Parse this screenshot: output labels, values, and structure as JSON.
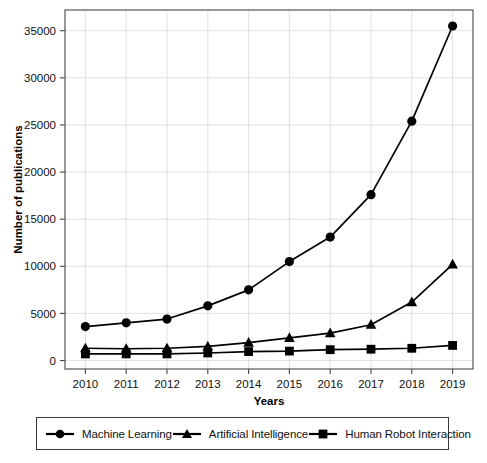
{
  "chart_data": {
    "type": "line",
    "title": "",
    "xlabel": "Years",
    "ylabel": "Number of publications",
    "categories": [
      2010,
      2011,
      2012,
      2013,
      2014,
      2015,
      2016,
      2017,
      2018,
      2019
    ],
    "x": [
      2010,
      2011,
      2012,
      2013,
      2014,
      2015,
      2016,
      2017,
      2018,
      2019
    ],
    "xtick_labels": [
      "2010",
      "2011",
      "2012",
      "2013",
      "2014",
      "2015",
      "2016",
      "2017",
      "2018",
      "2019"
    ],
    "ytick_labels": [
      "0",
      "5000",
      "10000",
      "15000",
      "20000",
      "25000",
      "30000",
      "35000"
    ],
    "yticks": [
      0,
      5000,
      10000,
      15000,
      20000,
      25000,
      30000,
      35000
    ],
    "ylim": [
      -900,
      37200
    ],
    "xlim": [
      2009.5,
      2019.5
    ],
    "grid": true,
    "legend_position": "below-plot",
    "series": [
      {
        "name": "Machine Learning",
        "marker": "circle",
        "color": "#000000",
        "values": [
          3600,
          4000,
          4400,
          5800,
          7500,
          10500,
          13100,
          17600,
          25400,
          35500
        ]
      },
      {
        "name": "Artificial Intelligence",
        "marker": "triangle",
        "color": "#000000",
        "values": [
          1300,
          1250,
          1300,
          1500,
          1900,
          2400,
          2900,
          3800,
          6200,
          10200
        ]
      },
      {
        "name": "Human Robot Interaction",
        "marker": "square",
        "color": "#000000",
        "values": [
          700,
          700,
          700,
          800,
          950,
          1000,
          1150,
          1200,
          1300,
          1600
        ]
      }
    ]
  },
  "axes": {
    "y_label": "Number of publications",
    "x_label": "Years"
  },
  "legend": {
    "entries": [
      {
        "label": "Machine Learning",
        "marker": "circle"
      },
      {
        "label": "Artificial Intelligence",
        "marker": "triangle"
      },
      {
        "label": "Human Robot Interaction",
        "marker": "square"
      }
    ]
  },
  "style": {
    "line_color": "#000000",
    "grid_color": "#d9d9d9",
    "frame_color": "#555555",
    "background": "#ffffff"
  }
}
